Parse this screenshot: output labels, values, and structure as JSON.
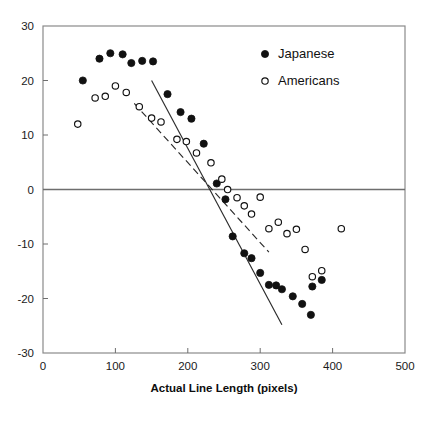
{
  "chart_data": {
    "type": "scatter",
    "title": "",
    "xlabel": "Actual Line Length (pixels)",
    "ylabel": "",
    "xlim": [
      0,
      500
    ],
    "ylim": [
      -30,
      30
    ],
    "xticks": [
      0,
      100,
      200,
      300,
      400,
      500
    ],
    "yticks": [
      -30,
      -20,
      -10,
      0,
      10,
      20,
      30
    ],
    "xtick_labels": [
      "0",
      "100",
      "200",
      "300",
      "400",
      "500"
    ],
    "ytick_labels": [
      "-30",
      "-20",
      "-10",
      "0",
      "10",
      "20",
      "30"
    ],
    "grid": false,
    "legend_position": "upper-right",
    "zero_line": true,
    "series": [
      {
        "name": "Japanese",
        "marker": "filled-circle",
        "color": "#111111",
        "points": [
          [
            55,
            20.0
          ],
          [
            78,
            24.0
          ],
          [
            93,
            25.0
          ],
          [
            110,
            24.8
          ],
          [
            122,
            23.2
          ],
          [
            137,
            23.6
          ],
          [
            152,
            23.5
          ],
          [
            172,
            17.5
          ],
          [
            190,
            14.2
          ],
          [
            205,
            13.0
          ],
          [
            222,
            8.4
          ],
          [
            240,
            1.1
          ],
          [
            252,
            -1.8
          ],
          [
            262,
            -8.6
          ],
          [
            278,
            -11.7
          ],
          [
            288,
            -12.6
          ],
          [
            300,
            -15.3
          ],
          [
            312,
            -17.5
          ],
          [
            322,
            -17.6
          ],
          [
            330,
            -18.3
          ],
          [
            345,
            -19.6
          ],
          [
            358,
            -21.0
          ],
          [
            370,
            -23.0
          ],
          [
            372,
            -17.8
          ],
          [
            385,
            -16.6
          ]
        ]
      },
      {
        "name": "Americans",
        "marker": "open-circle",
        "color": "#111111",
        "points": [
          [
            48,
            12.0
          ],
          [
            72,
            16.8
          ],
          [
            86,
            17.1
          ],
          [
            100,
            19.0
          ],
          [
            115,
            17.8
          ],
          [
            133,
            15.2
          ],
          [
            150,
            13.1
          ],
          [
            163,
            12.4
          ],
          [
            185,
            9.2
          ],
          [
            198,
            8.8
          ],
          [
            212,
            6.7
          ],
          [
            232,
            4.9
          ],
          [
            247,
            1.9
          ],
          [
            255,
            0.0
          ],
          [
            268,
            -1.5
          ],
          [
            278,
            -3.0
          ],
          [
            288,
            -4.5
          ],
          [
            300,
            -1.4
          ],
          [
            312,
            -7.2
          ],
          [
            325,
            -6.0
          ],
          [
            337,
            -8.1
          ],
          [
            350,
            -7.3
          ],
          [
            362,
            -11.0
          ],
          [
            372,
            -16.0
          ],
          [
            385,
            -14.9
          ],
          [
            412,
            -7.2
          ]
        ]
      }
    ],
    "trendlines": [
      {
        "name": "Japanese fit",
        "style": "solid",
        "x_start": 150,
        "y_start": 20.0,
        "x_end": 330,
        "y_end": -24.8
      },
      {
        "name": "Americans fit",
        "style": "dashed",
        "x_start": 126,
        "y_start": 15.8,
        "x_end": 312,
        "y_end": -11.5
      }
    ],
    "legend": [
      {
        "label": "Japanese",
        "marker": "filled-circle"
      },
      {
        "label": "Americans",
        "marker": "open-circle"
      }
    ]
  }
}
